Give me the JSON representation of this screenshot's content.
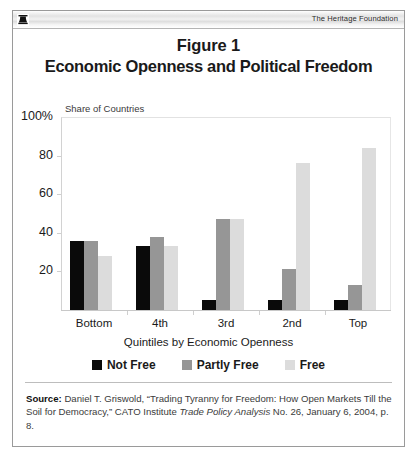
{
  "header": {
    "logo_icon": "heritage-bell-logo-icon",
    "title": "The Heritage Foundation"
  },
  "figure": {
    "label": "Figure 1",
    "title": "Economic Openness and Political Freedom"
  },
  "chart_data": {
    "type": "bar",
    "title": "Economic Openness and Political Freedom",
    "subtitle": "Figure 1",
    "plot_title": "Share of Countries",
    "xlabel": "Quintiles by Economic Openness",
    "ylabel": "",
    "y_unit": "100%",
    "categories": [
      "Bottom",
      "4th",
      "3rd",
      "2nd",
      "Top"
    ],
    "ylim": [
      0,
      100
    ],
    "yticks": [
      20,
      40,
      60,
      80,
      100
    ],
    "ytick_labels": [
      "20",
      "40",
      "60",
      "80",
      "100%"
    ],
    "grid": false,
    "legend_position": "bottom",
    "series": [
      {
        "name": "Not Free",
        "color": "#0a0a0a",
        "values": [
          36,
          33,
          5,
          5,
          5
        ]
      },
      {
        "name": "Partly Free",
        "color": "#969696",
        "values": [
          36,
          38,
          47,
          21,
          13
        ]
      },
      {
        "name": "Free",
        "color": "#dcdcdc",
        "values": [
          28,
          33,
          47,
          76,
          84
        ]
      }
    ]
  },
  "source": {
    "label": "Source:",
    "text": " Daniel T. Griswold, “Trading Tyranny for Freedom: How Open Markets Till the Soil for Democracy,” CATO Institute ",
    "italic": "Trade Policy Analysis",
    "text_tail": " No. 26, January 6, 2004, p. 8."
  }
}
